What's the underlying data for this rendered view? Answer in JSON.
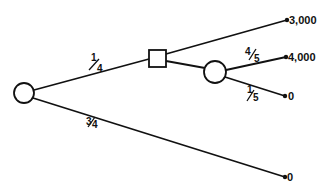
{
  "diagram": {
    "type": "decision-tree",
    "colors": {
      "stroke": "#111111",
      "background": "#ffffff"
    },
    "nodes": [
      {
        "id": "root",
        "kind": "chance",
        "shape": "circle",
        "cx": 24,
        "cy": 93,
        "r": 10
      },
      {
        "id": "decision",
        "kind": "decision",
        "shape": "square",
        "x": 149,
        "y": 50,
        "size": 17
      },
      {
        "id": "chance2",
        "kind": "chance",
        "shape": "circle",
        "cx": 215,
        "cy": 72,
        "r": 11
      }
    ],
    "branches": [
      {
        "from": "root",
        "to": "decision",
        "probability": {
          "num": "1",
          "den": "4",
          "text": "1/4"
        }
      },
      {
        "from": "root",
        "to": "terminal-4",
        "probability": {
          "num": "3",
          "den": "4",
          "text": "3/4"
        }
      },
      {
        "from": "decision",
        "to": "terminal-1",
        "probability": null
      },
      {
        "from": "decision",
        "to": "chance2",
        "probability": null
      },
      {
        "from": "chance2",
        "to": "terminal-2",
        "probability": {
          "num": "4",
          "den": "5",
          "text": "4/5"
        }
      },
      {
        "from": "chance2",
        "to": "terminal-3",
        "probability": {
          "num": "1",
          "den": "5",
          "text": "1/5"
        }
      }
    ],
    "terminals": [
      {
        "id": "terminal-1",
        "payoff": "3,000"
      },
      {
        "id": "terminal-2",
        "payoff": "4,000"
      },
      {
        "id": "terminal-3",
        "payoff": "0"
      },
      {
        "id": "terminal-4",
        "payoff": "0"
      }
    ]
  }
}
